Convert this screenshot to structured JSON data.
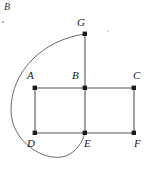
{
  "figure": {
    "title_region": "graph-diagram",
    "width": 146,
    "height": 175,
    "background_color": "#ffffff",
    "edge_color": "#555555",
    "curve_color": "#6b6b6b",
    "node_color": "#1a1a1a",
    "label_color": "#1a1a1a",
    "nodes": [
      {
        "id": "G",
        "label": "G",
        "x": 85,
        "y": 34,
        "label_x": 77,
        "label_y": 17
      },
      {
        "id": "A",
        "label": "A",
        "x": 35,
        "y": 88,
        "label_x": 27,
        "label_y": 70
      },
      {
        "id": "B",
        "label": "B",
        "x": 85,
        "y": 88,
        "label_x": 72,
        "label_y": 70
      },
      {
        "id": "C",
        "label": "C",
        "x": 134,
        "y": 88,
        "label_x": 133,
        "label_y": 70
      },
      {
        "id": "D",
        "label": "D",
        "x": 35,
        "y": 133,
        "label_x": 27,
        "label_y": 138
      },
      {
        "id": "E",
        "label": "E",
        "x": 85,
        "y": 133,
        "label_x": 84,
        "label_y": 138
      },
      {
        "id": "F",
        "label": "F",
        "x": 134,
        "y": 133,
        "label_x": 134,
        "label_y": 138
      }
    ],
    "straight_edges": [
      {
        "from": "A",
        "to": "B"
      },
      {
        "from": "B",
        "to": "C"
      },
      {
        "from": "D",
        "to": "E"
      },
      {
        "from": "E",
        "to": "F"
      },
      {
        "from": "A",
        "to": "D"
      },
      {
        "from": "B",
        "to": "E"
      },
      {
        "from": "C",
        "to": "F"
      },
      {
        "from": "G",
        "to": "B"
      }
    ],
    "curved_edge": {
      "from": "G",
      "to": "E",
      "description": "long loop sweeping left around A and D",
      "path": "M 85 34 C 42 40, 11 72, 11 110 C 11 142, 45 163, 66 156 C 76 152, 82 143, 85 133"
    },
    "stray_marks": [
      {
        "id": "stray-B",
        "type": "label",
        "text": "B",
        "x": 4,
        "y": 2
      },
      {
        "id": "stray-dot-left",
        "type": "speck",
        "x": 2,
        "y": 21,
        "size": 2
      },
      {
        "id": "stray-dot-right",
        "type": "speck",
        "x": 107,
        "y": 30,
        "size": 2
      }
    ]
  }
}
